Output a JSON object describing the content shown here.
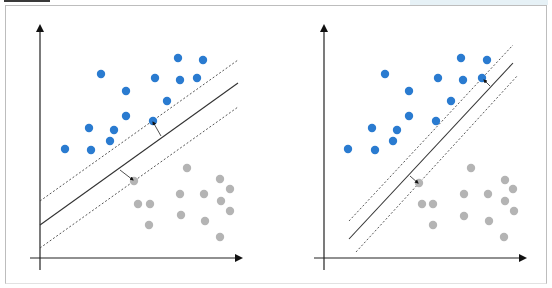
{
  "colors": {
    "class_a": "#2a7bd0",
    "class_b": "#b4b4b4",
    "axis": "#222222",
    "hyperplane": "#333333",
    "margin": "#444444",
    "frame": "#bdbdbd"
  },
  "panels": [
    {
      "name": "wide-margin-svm",
      "axes": {
        "origin": [
          40,
          258
        ],
        "y_top": 22,
        "y_bottom": 270,
        "x_left": 30,
        "x_right": 245
      },
      "hyperplane": [
        [
          40,
          225
        ],
        [
          238,
          83
        ]
      ],
      "margin_upper": [
        [
          40,
          201
        ],
        [
          238,
          60
        ]
      ],
      "margin_lower": [
        [
          40,
          248
        ],
        [
          238,
          107
        ]
      ],
      "support_arrows": [
        {
          "from": [
            161,
            136
          ],
          "to": [
            153,
            122
          ]
        },
        {
          "from": [
            120,
            170
          ],
          "to": [
            133,
            180
          ]
        }
      ],
      "class_a_points": [
        [
          101,
          74
        ],
        [
          178,
          58
        ],
        [
          203,
          60
        ],
        [
          155,
          78
        ],
        [
          180,
          80
        ],
        [
          197,
          78
        ],
        [
          126,
          91
        ],
        [
          167,
          101
        ],
        [
          126,
          116
        ],
        [
          153,
          121
        ],
        [
          89,
          128
        ],
        [
          114,
          130
        ],
        [
          65,
          149
        ],
        [
          91,
          150
        ],
        [
          110,
          141
        ]
      ],
      "class_b_points": [
        [
          134,
          181
        ],
        [
          187,
          168
        ],
        [
          220,
          179
        ],
        [
          230,
          189
        ],
        [
          138,
          204
        ],
        [
          150,
          204
        ],
        [
          180,
          194
        ],
        [
          204,
          194
        ],
        [
          221,
          201
        ],
        [
          230,
          211
        ],
        [
          149,
          225
        ],
        [
          181,
          215
        ],
        [
          205,
          221
        ],
        [
          220,
          237
        ]
      ]
    },
    {
      "name": "narrow-margin-svm",
      "axes": {
        "origin": [
          324,
          258
        ],
        "y_top": 22,
        "y_bottom": 270,
        "x_left": 314,
        "x_right": 529
      },
      "hyperplane": [
        [
          349,
          239
        ],
        [
          513,
          63
        ]
      ],
      "margin_upper": [
        [
          349,
          221
        ],
        [
          513,
          45
        ]
      ],
      "margin_lower": [
        [
          356,
          252
        ],
        [
          518,
          75
        ]
      ],
      "support_arrows": [
        {
          "from": [
            490,
            86
          ],
          "to": [
            484,
            80
          ]
        },
        {
          "from": [
            410,
            176
          ],
          "to": [
            418,
            183
          ]
        }
      ],
      "class_a_points": [
        [
          385,
          74
        ],
        [
          461,
          58
        ],
        [
          487,
          60
        ],
        [
          438,
          78
        ],
        [
          463,
          80
        ],
        [
          482,
          78
        ],
        [
          409,
          91
        ],
        [
          451,
          101
        ],
        [
          409,
          116
        ],
        [
          436,
          121
        ],
        [
          372,
          128
        ],
        [
          397,
          130
        ],
        [
          348,
          149
        ],
        [
          375,
          150
        ],
        [
          393,
          141
        ]
      ],
      "class_b_points": [
        [
          419,
          183
        ],
        [
          422,
          204
        ],
        [
          433,
          204
        ],
        [
          433,
          225
        ],
        [
          464,
          194
        ],
        [
          464,
          216
        ],
        [
          488,
          194
        ],
        [
          489,
          221
        ],
        [
          505,
          180
        ],
        [
          513,
          189
        ],
        [
          505,
          201
        ],
        [
          514,
          211
        ],
        [
          504,
          237
        ],
        [
          471,
          168
        ]
      ]
    }
  ]
}
